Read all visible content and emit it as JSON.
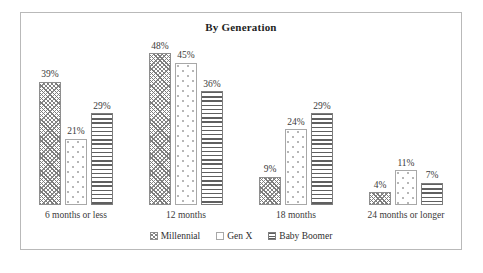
{
  "chart_data": {
    "type": "bar",
    "title": "By Generation",
    "xlabel": "",
    "ylabel": "",
    "ylim": [
      0,
      55
    ],
    "grid": false,
    "legend_position": "bottom",
    "value_suffix": "%",
    "categories": [
      "6 months or less",
      "12 months",
      "18 months",
      "24 months or longer"
    ],
    "series": [
      {
        "name": "Millennial",
        "pattern": "diagonal-crosshatch",
        "color": "#7a7a7a",
        "values": [
          39,
          48,
          9,
          4
        ],
        "labels": [
          "39%",
          "48%",
          "9%",
          "4%"
        ]
      },
      {
        "name": "Gen X",
        "pattern": "sparse-dots",
        "color": "#b4b4b4",
        "values": [
          21,
          45,
          24,
          11
        ],
        "labels": [
          "21%",
          "45%",
          "24%",
          "11%"
        ]
      },
      {
        "name": "Baby Boomer",
        "pattern": "horizontal-lines",
        "color": "#5f5f5f",
        "values": [
          29,
          36,
          29,
          7
        ],
        "labels": [
          "29%",
          "36%",
          "29%",
          "7%"
        ]
      }
    ]
  },
  "frame": {
    "border_color": "#b9b9b9",
    "background": "#ffffff"
  }
}
